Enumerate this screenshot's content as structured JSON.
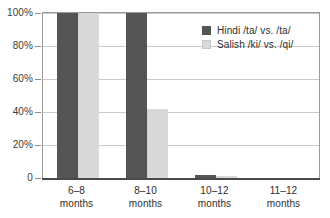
{
  "chart_data": {
    "type": "bar",
    "title": "",
    "xlabel": "",
    "ylabel": "",
    "ylim": [
      0,
      100
    ],
    "ytick_labels": [
      "0",
      "20%",
      "40%",
      "60%",
      "80%",
      "100%"
    ],
    "ytick_values": [
      0,
      20,
      40,
      60,
      80,
      100
    ],
    "grid": true,
    "legend_position": "upper-right-inside",
    "categories": [
      "6–8 months",
      "8–10 months",
      "10–12 months",
      "11–12 months"
    ],
    "category_lines": [
      {
        "line1": "6–8",
        "line2": "months"
      },
      {
        "line1": "8–10",
        "line2": "months"
      },
      {
        "line1": "10–12",
        "line2": "months"
      },
      {
        "line1": "11–12",
        "line2": "months"
      }
    ],
    "series": [
      {
        "name": "Hindi /ta/ vs. /ta/",
        "color": "#555555",
        "values": [
          100,
          100,
          2,
          0
        ]
      },
      {
        "name": "Salish /ki/ vs. /qi/",
        "color": "#d9d9d9",
        "values": [
          100,
          42,
          1,
          0
        ]
      }
    ]
  },
  "legend": {
    "items": [
      {
        "label": "Hindi /ta/ vs. /ta/",
        "color": "#555555"
      },
      {
        "label": "Salish /ki/ vs. /qi/",
        "color": "#d9d9d9"
      }
    ]
  },
  "axes": {
    "y": {
      "ticks": [
        {
          "label": "100%",
          "value": 100
        },
        {
          "label": "80%",
          "value": 80
        },
        {
          "label": "60%",
          "value": 60
        },
        {
          "label": "40%",
          "value": 40
        },
        {
          "label": "20%",
          "value": 20
        },
        {
          "label": "0",
          "value": 0
        }
      ]
    },
    "x": {
      "ticks": [
        {
          "line1": "6–8",
          "line2": "months"
        },
        {
          "line1": "8–10",
          "line2": "months"
        },
        {
          "line1": "10–12",
          "line2": "months"
        },
        {
          "line1": "11–12",
          "line2": "months"
        }
      ]
    }
  },
  "colors": {
    "series_dark": "#555555",
    "series_light": "#d9d9d9",
    "gridline": "#c9c9c9",
    "frame": "#9a9a9a",
    "baseline": "#4a4a4a",
    "text": "#2e2e2e"
  }
}
